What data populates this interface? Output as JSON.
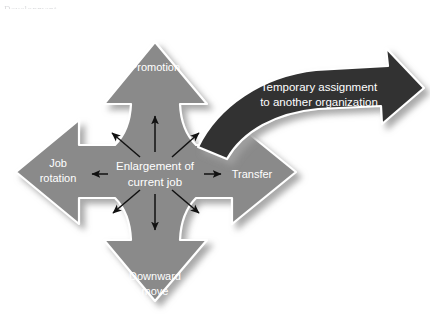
{
  "figure": {
    "type": "diagram",
    "diagram_kind": "four-directional cross arrow with curved outbound arrow",
    "background_color": "#ffffff",
    "cross_fill": "#8a8a8a",
    "cross_outline": "#ffffff",
    "curved_arrow_fill": "#333333",
    "curved_arrow_outline": "#ffffff",
    "internal_arrow_color": "#111111"
  },
  "page_remnant": {
    "text": "Development"
  },
  "labels": {
    "top": "Promotion",
    "left_line1": "Job",
    "left_line2": "rotation",
    "center_line1": "Enlargement of",
    "center_line2": "current job",
    "right": "Transfer",
    "bottom_line1": "Downward",
    "bottom_line2": "move",
    "curved_line1": "Temporary assignment",
    "curved_line2": "to another organization"
  },
  "directions": [
    {
      "name": "up",
      "label": "Promotion"
    },
    {
      "name": "left",
      "label": "Job rotation"
    },
    {
      "name": "right",
      "label": "Transfer"
    },
    {
      "name": "down",
      "label": "Downward move"
    },
    {
      "name": "center",
      "label": "Enlargement of current job"
    },
    {
      "name": "outbound-curved",
      "label": "Temporary assignment to another organization"
    }
  ],
  "internal_arrows": [
    "up-left",
    "up",
    "up-right",
    "left",
    "right",
    "down-left",
    "down",
    "down-right"
  ]
}
